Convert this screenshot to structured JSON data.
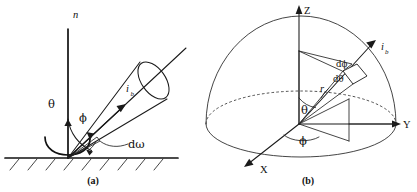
{
  "figure": {
    "background_color": "#ffffff",
    "ink_color": "#1a1a1a"
  },
  "panel_a": {
    "caption": "(a)",
    "normal_label": "n",
    "azimuth_label": "ϕ",
    "polar_label": "θ",
    "radiance_label": "i",
    "radiance_subscript": "b",
    "solid_angle_label": "dω",
    "surface_description": "hatched-ground-plane",
    "hatch_count": 9
  },
  "panel_b": {
    "caption": "(b)",
    "axis_z": "Z",
    "axis_y": "Y",
    "axis_x": "X",
    "polar_label": "θ",
    "azimuth_label": "ϕ",
    "radius_label": "r",
    "d_phi_label": "dϕ",
    "d_theta_label": "dθ",
    "radiance_label": "i",
    "radiance_subscript": "b",
    "hemisphere_description": "dome-with-dashed-equator"
  },
  "diagram_data": {
    "type": "diagram",
    "panels": 2,
    "subject": "spherical coordinate solid angle",
    "symbols": [
      "n",
      "θ",
      "ϕ",
      "dω",
      "r",
      "dθ",
      "dϕ",
      "i_b",
      "X",
      "Y",
      "Z"
    ]
  }
}
